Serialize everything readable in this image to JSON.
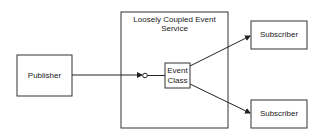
{
  "diagram": {
    "nodes": {
      "publisher": {
        "label": "Publisher"
      },
      "service": {
        "label": "Loosely Coupled Event Service"
      },
      "event_class": {
        "line1": "Event",
        "line2": "Class"
      },
      "subscriber_top": {
        "label": "Subscriber"
      },
      "subscriber_bottom": {
        "label": "Subscriber"
      }
    },
    "edges": [
      {
        "from": "publisher",
        "to": "event_class",
        "style": "arrow-to-interface-lollipop"
      },
      {
        "from": "event_class",
        "to": "subscriber_top",
        "style": "arrow"
      },
      {
        "from": "event_class",
        "to": "subscriber_bottom",
        "style": "arrow"
      }
    ],
    "colors": {
      "stroke": "#333333",
      "background": "#ffffff"
    }
  }
}
